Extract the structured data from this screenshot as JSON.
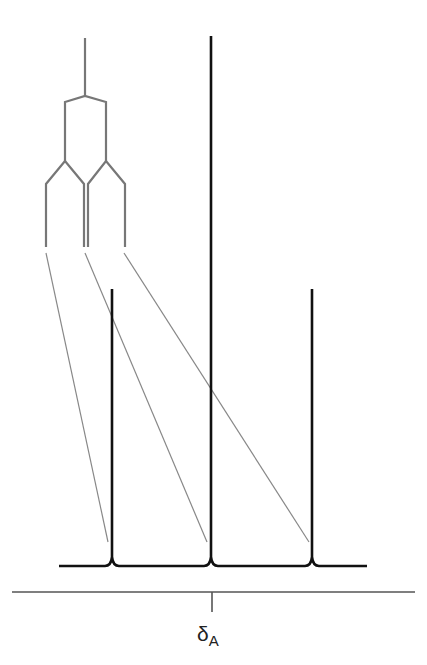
{
  "diagram": {
    "axis_label": {
      "symbol": "δ",
      "subscript": "A"
    },
    "colors": {
      "spectrum": "#111111",
      "tree": "#777777",
      "connector": "#888888",
      "axis": "#555555"
    },
    "tree": {
      "stem": {
        "x": 85,
        "y1": 38,
        "y2": 96
      },
      "level1": {
        "y_split": 96,
        "y_branch": 102,
        "y_end": 161,
        "left_x": 65,
        "right_x": 106
      },
      "level2": {
        "y_split": 161,
        "y_branch": 184,
        "y_end": 247,
        "legs_x": [
          46,
          84,
          88,
          125
        ]
      }
    },
    "connectors": [
      {
        "x1": 46,
        "y1": 253,
        "x2": 108,
        "y2": 542
      },
      {
        "x1": 85,
        "y1": 253,
        "x2": 207,
        "y2": 542
      },
      {
        "x1": 124,
        "y1": 253,
        "x2": 309,
        "y2": 542
      }
    ],
    "spectrum": {
      "baseline_y": 566,
      "x_start": 59,
      "x_end": 367,
      "peaks": [
        {
          "x": 112,
          "top_y": 289,
          "relative_intensity": 1
        },
        {
          "x": 211,
          "top_y": 36,
          "relative_intensity": 2
        },
        {
          "x": 312,
          "top_y": 289,
          "relative_intensity": 1
        }
      ]
    },
    "axis": {
      "y": 592,
      "x_start": 12,
      "x_end": 415,
      "tick_x": 212,
      "tick_y_end": 612
    }
  }
}
